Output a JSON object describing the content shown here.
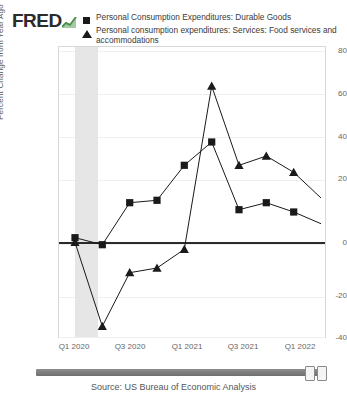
{
  "brand": {
    "name": "FRED",
    "mark_icon": "line-chart-icon"
  },
  "legend": [
    {
      "marker": "square",
      "label": "Personal Consumption Expenditures: Durable Goods"
    },
    {
      "marker": "triangle",
      "label": "Personal consumption expenditures: Services: Food services and accommodations"
    }
  ],
  "footer": {
    "source": "Source: US Bureau of Economic Analysis",
    "slider_left_handle": "range-handle-left",
    "slider_right_handle": "range-handle-right"
  },
  "chart_data": {
    "type": "line",
    "title": "",
    "xlabel": "",
    "ylabel": "Percent Change from Year Ago",
    "ylim": [
      -40,
      80
    ],
    "yticks": [
      80,
      60,
      40,
      20,
      0,
      -20,
      -40
    ],
    "xticks": [
      "Q1 2020",
      "Q3 2020",
      "Q1 2021",
      "Q3 2021",
      "Q1 2022"
    ],
    "grid": true,
    "legend_position": "top",
    "shaded_regions": [
      {
        "name": "recession",
        "x_start": "Q1 2020",
        "x_end": "Q2 2020",
        "color": "#e2e2e2"
      }
    ],
    "x": [
      "Q1 2020",
      "Q2 2020",
      "Q3 2020",
      "Q4 2020",
      "Q1 2021",
      "Q2 2021",
      "Q3 2021",
      "Q4 2021",
      "Q1 2022",
      "Q2 2022"
    ],
    "series": [
      {
        "name": "Personal Consumption Expenditures: Durable Goods",
        "marker": "square",
        "color": "#1a1a1a",
        "values": [
          0,
          -3,
          15,
          16,
          31,
          41,
          12,
          15,
          11,
          6
        ]
      },
      {
        "name": "Personal consumption expenditures: Services: Food services and accommodations",
        "marker": "triangle",
        "color": "#1a1a1a",
        "values": [
          -2,
          -38,
          -15,
          -13,
          -5,
          65,
          31,
          35,
          28,
          17
        ]
      }
    ]
  }
}
